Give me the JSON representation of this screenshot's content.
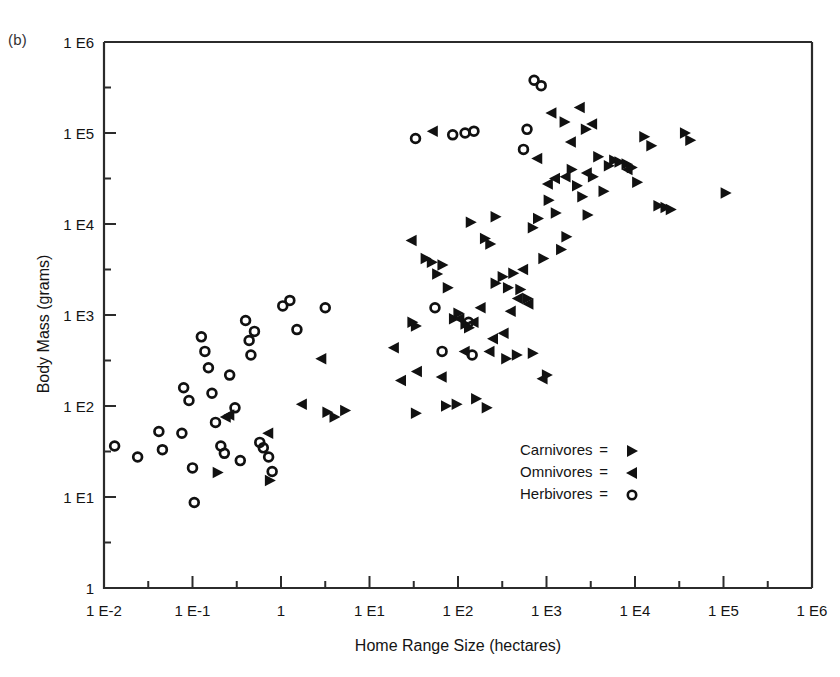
{
  "figure": {
    "panel_label": "(b)",
    "xlabel": "Home Range Size (hectares)",
    "ylabel": "Body Mass (grams)"
  },
  "legend": {
    "position": "inside-lower-right",
    "equals": "=",
    "entries": [
      {
        "label": "Carnivores",
        "marker": "right-triangle",
        "color": "#111111"
      },
      {
        "label": "Omnivores",
        "marker": "left-triangle",
        "color": "#111111"
      },
      {
        "label": "Herbivores",
        "marker": "open-circle",
        "color": "#111111"
      }
    ]
  },
  "chart_data": {
    "type": "scatter",
    "title": "",
    "xlabel": "Home Range Size (hectares)",
    "ylabel": "Body Mass (grams)",
    "xscale": "log10",
    "yscale": "log10",
    "xlim": [
      -2,
      6
    ],
    "ylim": [
      0,
      6
    ],
    "grid": false,
    "xticks": [
      -2,
      -1,
      0,
      1,
      2,
      3,
      4,
      5,
      6
    ],
    "xticklabels": [
      "1 E-2",
      "1 E-1",
      "1",
      "1 E1",
      "1 E2",
      "1 E3",
      "1 E4",
      "1 E5",
      "1 E6"
    ],
    "xminorticks": [
      -1.5,
      -0.5,
      0.5,
      1.5,
      2.5,
      3.5,
      4.5,
      5.5
    ],
    "yticks": [
      0,
      1,
      2,
      3,
      4,
      5,
      6
    ],
    "yticklabels": [
      "1",
      "1 E1",
      "1 E2",
      "1 E3",
      "1 E4",
      "1 E5",
      "1 E6"
    ],
    "yminorticks": [
      0.5,
      1.5,
      2.5,
      3.5,
      4.5,
      5.5
    ],
    "legend_position": "inside-lower-right",
    "series": [
      {
        "name": "Carnivores",
        "marker": "right-triangle",
        "color": "#111111",
        "points": [
          [
            -0.72,
            1.27
          ],
          [
            -0.13,
            1.18
          ],
          [
            0.52,
            1.93
          ],
          [
            0.6,
            1.88
          ],
          [
            0.72,
            1.95
          ],
          [
            1.48,
            2.92
          ],
          [
            1.52,
            2.88
          ],
          [
            1.63,
            3.62
          ],
          [
            1.7,
            3.58
          ],
          [
            1.76,
            3.45
          ],
          [
            1.82,
            3.55
          ],
          [
            1.88,
            3.3
          ],
          [
            1.95,
            2.96
          ],
          [
            2.0,
            3.02
          ],
          [
            2.08,
            2.9
          ],
          [
            2.12,
            2.86
          ],
          [
            2.3,
            3.84
          ],
          [
            2.36,
            3.78
          ],
          [
            2.42,
            3.35
          ],
          [
            2.5,
            3.42
          ],
          [
            2.56,
            3.3
          ],
          [
            2.62,
            3.46
          ],
          [
            2.7,
            3.28
          ],
          [
            2.78,
            3.18
          ],
          [
            2.84,
            3.96
          ],
          [
            2.9,
            4.06
          ],
          [
            2.96,
            3.62
          ],
          [
            3.02,
            4.26
          ],
          [
            3.1,
            4.12
          ],
          [
            3.16,
            3.72
          ],
          [
            3.22,
            3.86
          ],
          [
            3.28,
            4.6
          ],
          [
            3.34,
            4.42
          ],
          [
            3.4,
            4.3
          ],
          [
            3.46,
            4.1
          ],
          [
            3.52,
            4.52
          ],
          [
            3.58,
            4.74
          ],
          [
            3.64,
            4.36
          ],
          [
            3.7,
            4.64
          ],
          [
            3.76,
            4.7
          ],
          [
            3.82,
            4.68
          ],
          [
            3.9,
            4.66
          ],
          [
            3.96,
            4.62
          ],
          [
            4.02,
            4.46
          ],
          [
            4.1,
            4.96
          ],
          [
            4.18,
            4.86
          ],
          [
            4.26,
            4.2
          ],
          [
            4.34,
            4.18
          ],
          [
            4.4,
            4.16
          ],
          [
            4.56,
            5.0
          ],
          [
            4.62,
            4.92
          ],
          [
            5.02,
            4.34
          ],
          [
            3.0,
            2.34
          ],
          [
            2.84,
            2.58
          ],
          [
            2.66,
            2.56
          ],
          [
            2.54,
            2.52
          ],
          [
            2.2,
            2.08
          ],
          [
            1.98,
            2.02
          ],
          [
            1.86,
            2.0
          ],
          [
            2.32,
            1.98
          ],
          [
            1.52,
            1.92
          ],
          [
            3.2,
            5.12
          ],
          [
            3.44,
            5.04
          ],
          [
            2.42,
            4.08
          ],
          [
            2.14,
            4.02
          ]
        ]
      },
      {
        "name": "Omnivores",
        "marker": "left-triangle",
        "color": "#111111",
        "points": [
          [
            -0.62,
            1.88
          ],
          [
            -0.58,
            1.9
          ],
          [
            -0.14,
            1.7
          ],
          [
            0.24,
            2.02
          ],
          [
            0.46,
            2.52
          ],
          [
            1.28,
            2.64
          ],
          [
            1.48,
            3.82
          ],
          [
            1.54,
            2.38
          ],
          [
            1.82,
            2.32
          ],
          [
            2.02,
            2.96
          ],
          [
            2.18,
            2.92
          ],
          [
            2.26,
            3.08
          ],
          [
            2.4,
            2.74
          ],
          [
            2.52,
            2.8
          ],
          [
            2.6,
            3.04
          ],
          [
            2.68,
            3.18
          ],
          [
            2.8,
            3.12
          ],
          [
            2.9,
            4.72
          ],
          [
            3.02,
            4.44
          ],
          [
            3.1,
            4.5
          ],
          [
            3.22,
            4.52
          ],
          [
            3.28,
            4.9
          ],
          [
            3.06,
            5.22
          ],
          [
            3.38,
            5.28
          ],
          [
            3.52,
            5.1
          ],
          [
            2.96,
            2.3
          ],
          [
            3.46,
            4.56
          ],
          [
            2.08,
            2.6
          ],
          [
            1.72,
            5.02
          ],
          [
            1.36,
            2.28
          ],
          [
            2.36,
            2.6
          ],
          [
            2.74,
            3.5
          ],
          [
            3.92,
            4.6
          ]
        ]
      },
      {
        "name": "Herbivores",
        "marker": "open-circle",
        "color": "#111111",
        "points": [
          [
            -1.88,
            1.56
          ],
          [
            -1.62,
            1.44
          ],
          [
            -1.38,
            1.72
          ],
          [
            -1.34,
            1.52
          ],
          [
            -1.12,
            1.7
          ],
          [
            -1.1,
            2.2
          ],
          [
            -1.04,
            2.06
          ],
          [
            -1.0,
            1.32
          ],
          [
            -0.98,
            0.94
          ],
          [
            -0.9,
            2.76
          ],
          [
            -0.86,
            2.6
          ],
          [
            -0.82,
            2.42
          ],
          [
            -0.78,
            2.14
          ],
          [
            -0.74,
            1.82
          ],
          [
            -0.68,
            1.56
          ],
          [
            -0.64,
            1.48
          ],
          [
            -0.58,
            2.34
          ],
          [
            -0.52,
            1.98
          ],
          [
            -0.46,
            1.4
          ],
          [
            -0.4,
            2.94
          ],
          [
            -0.36,
            2.72
          ],
          [
            -0.34,
            2.56
          ],
          [
            -0.3,
            2.82
          ],
          [
            -0.24,
            1.6
          ],
          [
            -0.2,
            1.54
          ],
          [
            -0.14,
            1.44
          ],
          [
            -0.1,
            1.28
          ],
          [
            0.02,
            3.1
          ],
          [
            0.1,
            3.16
          ],
          [
            0.18,
            2.84
          ],
          [
            0.5,
            3.08
          ],
          [
            1.52,
            4.94
          ],
          [
            1.94,
            4.98
          ],
          [
            2.08,
            5.0
          ],
          [
            2.18,
            5.02
          ],
          [
            2.86,
            5.58
          ],
          [
            2.94,
            5.52
          ],
          [
            2.78,
            5.04
          ],
          [
            2.74,
            4.82
          ],
          [
            1.74,
            3.08
          ],
          [
            2.12,
            2.92
          ],
          [
            2.16,
            2.56
          ],
          [
            1.82,
            2.6
          ]
        ]
      }
    ]
  }
}
